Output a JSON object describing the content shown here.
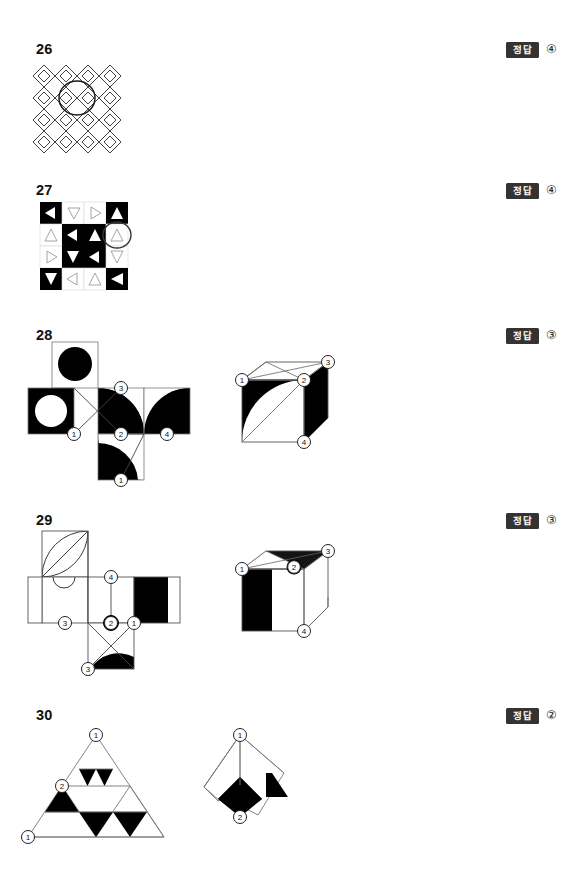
{
  "page": {
    "width": 573,
    "height": 870,
    "background": "#ffffff",
    "badge_color": "#333333",
    "ink_color": "#000000"
  },
  "answer_label": "정답",
  "questions": [
    {
      "number": "26",
      "answer": "④",
      "figure_type": "diamond-lattice",
      "description": "4x4 lattice of nested diamonds with one circled",
      "grid": {
        "rows": 4,
        "cols": 4,
        "cell": 22
      },
      "circled_cell": {
        "row": 1,
        "col": 1
      }
    },
    {
      "number": "27",
      "answer": "④",
      "figure_type": "triangle-grid",
      "description": "4x4 checker grid of triangles, one cell circled",
      "grid": {
        "rows": 4,
        "cols": 4,
        "cell": 22
      },
      "circled_cell": {
        "row": 1,
        "col": 3
      },
      "cells": [
        [
          {
            "bg": "black",
            "tri": "left",
            "fill": "white"
          },
          {
            "bg": "white",
            "tri": "down",
            "fill": "white"
          },
          {
            "bg": "white",
            "tri": "right",
            "fill": "white"
          },
          {
            "bg": "black",
            "tri": "up",
            "fill": "white"
          }
        ],
        [
          {
            "bg": "white",
            "tri": "up",
            "fill": "white"
          },
          {
            "bg": "black",
            "tri": "left",
            "fill": "white"
          },
          {
            "bg": "black",
            "tri": "up",
            "fill": "white"
          },
          {
            "bg": "white",
            "tri": "up",
            "fill": "white"
          }
        ],
        [
          {
            "bg": "white",
            "tri": "right",
            "fill": "white"
          },
          {
            "bg": "black",
            "tri": "down",
            "fill": "white"
          },
          {
            "bg": "black",
            "tri": "left",
            "fill": "white"
          },
          {
            "bg": "white",
            "tri": "down",
            "fill": "white"
          }
        ],
        [
          {
            "bg": "black",
            "tri": "down",
            "fill": "white"
          },
          {
            "bg": "white",
            "tri": "left",
            "fill": "white"
          },
          {
            "bg": "white",
            "tri": "up",
            "fill": "white"
          },
          {
            "bg": "black",
            "tri": "left",
            "fill": "white"
          }
        ]
      ]
    },
    {
      "number": "28",
      "answer": "③",
      "figure_type": "cube-net-and-cube",
      "description": "Cube net with circle/disc faces and quarter-circle faces, plus folded cube",
      "net_vertex_labels": [
        "3",
        "1",
        "2",
        "4",
        "1"
      ],
      "cube_vertex_labels": [
        "1",
        "2",
        "3",
        "4"
      ]
    },
    {
      "number": "29",
      "answer": "③",
      "figure_type": "cube-net-and-cube",
      "description": "Cube net with lens shape, half-disc, black square, plus folded cube",
      "net_vertex_labels": [
        "4",
        "3",
        "2",
        "1",
        "3"
      ],
      "cube_vertex_labels": [
        "1",
        "2",
        "3",
        "4"
      ]
    },
    {
      "number": "30",
      "answer": "②",
      "figure_type": "triangle-net-and-folded",
      "description": "Sierpinski-like triangle net with black sub-triangles, plus folded tetrahedron view",
      "net_vertex_labels": [
        "1",
        "2",
        "1"
      ],
      "folded_vertex_labels": [
        "1",
        "2"
      ]
    }
  ]
}
